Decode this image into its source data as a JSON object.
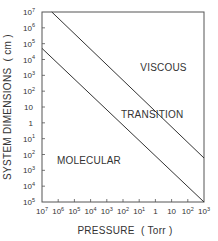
{
  "chart_data": {
    "type": "line",
    "title": "",
    "xlabel": "PRESSURE  ( Torr )",
    "ylabel": "SYSTEM DIMENSIONS  ( cm )",
    "xscale": "log",
    "yscale": "log",
    "xlim": [
      1e-07,
      1000.0
    ],
    "ylim": [
      1e-05,
      10000000.0
    ],
    "grid": false,
    "legend": "none",
    "x_ticks": [
      {
        "base": "10",
        "exp": "-7",
        "value": -7
      },
      {
        "base": "10",
        "exp": "-6",
        "value": -6
      },
      {
        "base": "10",
        "exp": "-5",
        "value": -5
      },
      {
        "base": "10",
        "exp": "-4",
        "value": -4
      },
      {
        "base": "10",
        "exp": "-3",
        "value": -3
      },
      {
        "base": "10",
        "exp": "-2",
        "value": -2
      },
      {
        "base": "10",
        "exp": "-1",
        "value": -1
      },
      {
        "base": "1",
        "exp": "",
        "value": 0
      },
      {
        "base": "10",
        "exp": "",
        "value": 1
      },
      {
        "base": "10",
        "exp": "2",
        "value": 2
      },
      {
        "base": "10",
        "exp": "3",
        "value": 3
      }
    ],
    "y_ticks": [
      {
        "base": "10",
        "exp": "7",
        "value": 7
      },
      {
        "base": "10",
        "exp": "6",
        "value": 6
      },
      {
        "base": "10",
        "exp": "5",
        "value": 5
      },
      {
        "base": "10",
        "exp": "4",
        "value": 4
      },
      {
        "base": "10",
        "exp": "3",
        "value": 3
      },
      {
        "base": "10",
        "exp": "2",
        "value": 2
      },
      {
        "base": "10",
        "exp": "",
        "value": 1
      },
      {
        "base": "1",
        "exp": "",
        "value": 0
      },
      {
        "base": "10",
        "exp": "-1",
        "value": -1
      },
      {
        "base": "10",
        "exp": "-2",
        "value": -2
      },
      {
        "base": "10",
        "exp": "-3",
        "value": -3
      },
      {
        "base": "10",
        "exp": "-4",
        "value": -4
      },
      {
        "base": "10",
        "exp": "-5",
        "value": -5
      }
    ],
    "series": [
      {
        "name": "viscous-transition boundary",
        "description": "Upper boundary line (P·d ≈ 5 Torr·cm)",
        "x": [
          4e-07,
          1000.0
        ],
        "y": [
          10000000.0,
          0.006
        ]
      },
      {
        "name": "transition-molecular boundary",
        "description": "Lower boundary line (P·d ≈ 5×10⁻³ Torr·cm)",
        "x": [
          1e-07,
          1000.0
        ],
        "y": [
          50000.0,
          1e-05
        ]
      }
    ],
    "annotations": [
      {
        "text": "VISCOUS",
        "x_log": 0.5,
        "y_log": 3.3
      },
      {
        "text": "TRANSITION",
        "x_log": -0.2,
        "y_log": 0.3
      },
      {
        "text": "MOLECULAR",
        "x_log": -4.1,
        "y_log": -2.6
      }
    ]
  },
  "colors": {
    "line": "#333333",
    "frame": "#555555",
    "text": "#333333",
    "background": "#ffffff"
  }
}
